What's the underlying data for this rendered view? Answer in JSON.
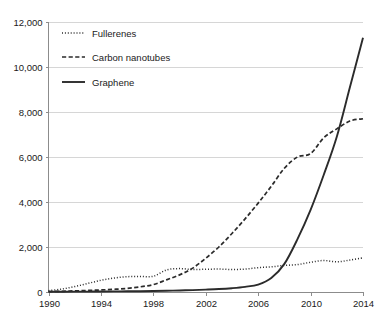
{
  "chart_data": {
    "type": "line",
    "title": "",
    "subtitle": "",
    "xlabel": "",
    "ylabel": "",
    "xlim": [
      1990,
      2014
    ],
    "ylim": [
      0,
      12000
    ],
    "grid": "horizontal",
    "legend_position": "top-left",
    "x_ticks": [
      "1990",
      "1994",
      "1998",
      "2002",
      "2006",
      "2010",
      "2014"
    ],
    "x_tick_values": [
      1990,
      1994,
      1998,
      2002,
      2006,
      2010,
      2014
    ],
    "y_ticks": [
      "0",
      "2,000",
      "4,000",
      "6,000",
      "8,000",
      "10,000",
      "12,000"
    ],
    "y_tick_values": [
      0,
      2000,
      4000,
      6000,
      8000,
      10000,
      12000
    ],
    "x": [
      1990,
      1991,
      1992,
      1993,
      1994,
      1995,
      1996,
      1997,
      1998,
      1999,
      2000,
      2001,
      2002,
      2003,
      2004,
      2005,
      2006,
      2007,
      2008,
      2009,
      2010,
      2011,
      2012,
      2013,
      2014
    ],
    "series": [
      {
        "name": "Fullerenes",
        "style": "dotted",
        "color": "#2b2b2b",
        "values": [
          60,
          130,
          240,
          380,
          520,
          620,
          680,
          690,
          700,
          980,
          1040,
          1000,
          1010,
          1020,
          1000,
          1020,
          1080,
          1120,
          1180,
          1220,
          1320,
          1400,
          1340,
          1420,
          1520
        ]
      },
      {
        "name": "Carbon nanotubes",
        "style": "dashed",
        "color": "#2b2b2b",
        "values": [
          20,
          30,
          50,
          70,
          90,
          120,
          160,
          230,
          330,
          540,
          760,
          1060,
          1500,
          2000,
          2600,
          3250,
          3950,
          4700,
          5500,
          6000,
          6150,
          6850,
          7250,
          7600,
          7700
        ]
      },
      {
        "name": "Graphene",
        "style": "solid",
        "color": "#2b2b2b",
        "values": [
          10,
          12,
          15,
          18,
          22,
          26,
          30,
          36,
          44,
          55,
          70,
          85,
          105,
          130,
          170,
          230,
          330,
          620,
          1250,
          2350,
          3650,
          5200,
          6900,
          9100,
          11300
        ]
      }
    ]
  },
  "legend": {
    "items": [
      {
        "label": "Fullerenes",
        "style": "dotted"
      },
      {
        "label": "Carbon nanotubes",
        "style": "dashed"
      },
      {
        "label": "Graphene",
        "style": "solid"
      }
    ]
  },
  "axes": {
    "x_tick_labels": [
      "1990",
      "1994",
      "1998",
      "2002",
      "2006",
      "2010",
      "2014"
    ],
    "y_tick_labels": [
      "0",
      "2,000",
      "4,000",
      "6,000",
      "8,000",
      "10,000",
      "12,000"
    ]
  }
}
